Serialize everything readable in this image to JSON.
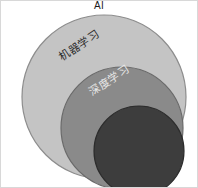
{
  "diagram": {
    "type": "nested-venn",
    "background_color": "#ffffff",
    "frame_color": "#d8d8d8",
    "width": 198,
    "height": 188,
    "labels": {
      "outer": "AI",
      "middle": "机器学习",
      "inner": "深度学习"
    },
    "sets": [
      {
        "name": "outer-set",
        "label": "AI",
        "fill_color": "#c4c4c4",
        "stroke_color": "#8d8d8d",
        "cx": 104,
        "cy": 97,
        "r": 82,
        "label_color": "#1b1b1b",
        "label_rotation": 0
      },
      {
        "name": "middle-set",
        "label": "机器学习",
        "fill_color": "#8a8a8a",
        "stroke_color": "#6a6a6a",
        "cx": 122,
        "cy": 128,
        "r": 61,
        "label_color": "#2b2b2b",
        "label_rotation": -34
      },
      {
        "name": "inner-set",
        "label": "深度学习",
        "fill_color": "#3d3d3d",
        "stroke_color": "#2c2c2c",
        "cx": 139,
        "cy": 151,
        "r": 45,
        "label_color": "#e8e8e8",
        "label_rotation": -34
      }
    ]
  },
  "chart_data": {
    "type": "diagram",
    "subtype": "nested-venn",
    "title": "AI",
    "categories": [
      "AI",
      "机器学习",
      "深度学习"
    ],
    "relationship": "containment",
    "nesting_order": [
      "AI",
      "机器学习",
      "深度学习"
    ],
    "values": [
      82,
      61,
      45
    ],
    "value_meaning": "circle radius in pixels",
    "colors": [
      "#c4c4c4",
      "#8a8a8a",
      "#3d3d3d"
    ],
    "centers": [
      [
        104,
        97
      ],
      [
        122,
        128
      ],
      [
        139,
        151
      ]
    ],
    "legend": "none",
    "grid": false,
    "xlabel": "",
    "ylabel": ""
  }
}
